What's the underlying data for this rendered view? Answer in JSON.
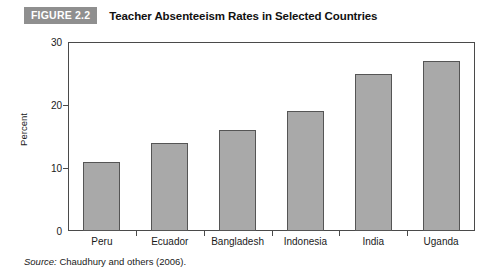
{
  "header": {
    "badge": "FIGURE 2.2",
    "title": "Teacher Absenteeism Rates in Selected Countries"
  },
  "source": {
    "lead": "Source:",
    "text": " Chaudhury and others (2006)."
  },
  "colors": {
    "badge_bg": "#8f8f8f",
    "bar_fill": "#a9a9a9",
    "bar_stroke": "#555555",
    "axis": "#4a4a4a"
  },
  "chart_data": {
    "type": "bar",
    "title": "Teacher Absenteeism Rates in Selected Countries",
    "categories": [
      "Peru",
      "Ecuador",
      "Bangladesh",
      "Indonesia",
      "India",
      "Uganda"
    ],
    "values": [
      11,
      14,
      16,
      19,
      25,
      27
    ],
    "xlabel": "",
    "ylabel": "Percent",
    "ylim": [
      0,
      30
    ],
    "yticks": [
      0,
      10,
      20,
      30
    ],
    "ytick_labels": [
      "0",
      "10",
      "20",
      "30"
    ],
    "grid": false,
    "legend": null,
    "series": [
      {
        "name": "Teacher absenteeism rate",
        "values": [
          11,
          14,
          16,
          19,
          25,
          27
        ]
      }
    ]
  }
}
